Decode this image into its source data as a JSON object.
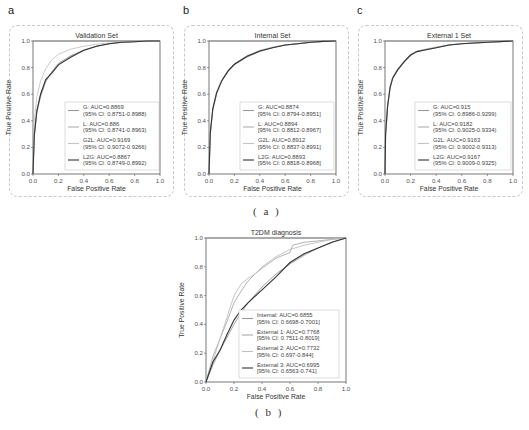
{
  "figure": {
    "caption_a": "( a )",
    "caption_b": "( b )",
    "panel_letters": [
      "a",
      "b",
      "c"
    ]
  },
  "chart_data": [
    {
      "type": "line",
      "panel": "a",
      "title": "Validation Set",
      "xlabel": "False Positive Rate",
      "ylabel": "True Positive Rate",
      "xlim": [
        0,
        1
      ],
      "ylim": [
        0,
        1
      ],
      "xticks": [
        "0.0",
        "0.2",
        "0.4",
        "0.6",
        "0.8",
        "1.0"
      ],
      "yticks": [
        "0.0",
        "0.2",
        "0.4",
        "0.6",
        "0.8",
        "1.0"
      ],
      "legend_position": "lower right",
      "series": [
        {
          "name": "G",
          "label": "G: AUC=0.8869",
          "ci": "(95% CI: 0.8751-0.8988)",
          "auc": 0.8869,
          "color": "#9a9a9a",
          "x": [
            0,
            0.01,
            0.03,
            0.06,
            0.1,
            0.15,
            0.2,
            0.3,
            0.4,
            0.5,
            0.6,
            0.7,
            0.8,
            0.9,
            1.0
          ],
          "y": [
            0,
            0.3,
            0.48,
            0.6,
            0.7,
            0.77,
            0.83,
            0.89,
            0.93,
            0.96,
            0.98,
            0.99,
            0.995,
            1.0,
            1.0
          ]
        },
        {
          "name": "L",
          "label": "L: AUC=0.886",
          "ci": "(95% CI: 0.8741-0.8963)",
          "auc": 0.886,
          "color": "#b0b0b0",
          "x": [
            0,
            0.01,
            0.03,
            0.06,
            0.1,
            0.15,
            0.2,
            0.3,
            0.4,
            0.5,
            0.6,
            0.7,
            0.8,
            0.9,
            1.0
          ],
          "y": [
            0,
            0.28,
            0.46,
            0.58,
            0.69,
            0.77,
            0.83,
            0.89,
            0.93,
            0.96,
            0.98,
            0.99,
            0.995,
            1.0,
            1.0
          ]
        },
        {
          "name": "G2L",
          "label": "G2L: AUC=0.9169",
          "ci": "(95% CI: 0.9072-0.9266)",
          "auc": 0.9169,
          "color": "#c4c4c4",
          "x": [
            0,
            0.01,
            0.03,
            0.06,
            0.1,
            0.15,
            0.2,
            0.3,
            0.4,
            0.5,
            0.6,
            0.7,
            0.8,
            0.9,
            1.0
          ],
          "y": [
            0,
            0.4,
            0.58,
            0.7,
            0.79,
            0.86,
            0.9,
            0.94,
            0.96,
            0.975,
            0.985,
            0.99,
            0.995,
            1.0,
            1.0
          ]
        },
        {
          "name": "L2G",
          "label": "L2G: AUC=0.8867",
          "ci": "(95% CI: 0.8749-0.8992)",
          "auc": 0.8867,
          "color": "#333333",
          "x": [
            0,
            0.01,
            0.03,
            0.06,
            0.1,
            0.15,
            0.2,
            0.3,
            0.4,
            0.5,
            0.6,
            0.7,
            0.8,
            0.9,
            1.0
          ],
          "y": [
            0,
            0.29,
            0.47,
            0.6,
            0.71,
            0.76,
            0.82,
            0.88,
            0.93,
            0.96,
            0.98,
            0.99,
            0.995,
            1.0,
            1.0
          ]
        }
      ]
    },
    {
      "type": "line",
      "panel": "b",
      "title": "Internal Set",
      "xlabel": "False Positive Rate",
      "ylabel": "True Positive Rate",
      "xlim": [
        0,
        1
      ],
      "ylim": [
        0,
        1
      ],
      "xticks": [
        "0.0",
        "0.2",
        "0.4",
        "0.6",
        "0.8",
        "1.0"
      ],
      "yticks": [
        "0.0",
        "0.2",
        "0.4",
        "0.6",
        "0.8",
        "1.0"
      ],
      "legend_position": "lower right",
      "series": [
        {
          "name": "G",
          "label": "G: AUC=0.8874",
          "ci": "[95% CI: 0.8794-0.8951]",
          "auc": 0.8874,
          "color": "#9a9a9a",
          "x": [
            0,
            0.01,
            0.03,
            0.06,
            0.1,
            0.15,
            0.2,
            0.3,
            0.4,
            0.5,
            0.6,
            0.7,
            0.8,
            0.9,
            1.0
          ],
          "y": [
            0,
            0.3,
            0.48,
            0.6,
            0.7,
            0.77,
            0.82,
            0.88,
            0.92,
            0.95,
            0.97,
            0.98,
            0.99,
            0.997,
            1.0
          ]
        },
        {
          "name": "L",
          "label": "L: AUC=0.8894",
          "ci": "[95% CI: 0.8812-0.8967]",
          "auc": 0.8894,
          "color": "#b0b0b0",
          "x": [
            0,
            0.01,
            0.03,
            0.06,
            0.1,
            0.15,
            0.2,
            0.3,
            0.4,
            0.5,
            0.6,
            0.7,
            0.8,
            0.9,
            1.0
          ],
          "y": [
            0,
            0.31,
            0.49,
            0.61,
            0.7,
            0.775,
            0.825,
            0.885,
            0.925,
            0.95,
            0.97,
            0.98,
            0.99,
            0.997,
            1.0
          ]
        },
        {
          "name": "G2L",
          "label": "G2L: AUC=0.8912",
          "ci": "[95% CI: 0.8837-0.8991]",
          "auc": 0.8912,
          "color": "#c4c4c4",
          "x": [
            0,
            0.01,
            0.03,
            0.06,
            0.1,
            0.15,
            0.2,
            0.3,
            0.4,
            0.5,
            0.6,
            0.7,
            0.8,
            0.9,
            1.0
          ],
          "y": [
            0,
            0.32,
            0.5,
            0.62,
            0.71,
            0.78,
            0.83,
            0.89,
            0.93,
            0.955,
            0.97,
            0.98,
            0.99,
            0.997,
            1.0
          ]
        },
        {
          "name": "L2G",
          "label": "L2G: AUC=0.8893",
          "ci": "[95% CI: 0.8818-0.8968]",
          "auc": 0.8893,
          "color": "#333333",
          "x": [
            0,
            0.01,
            0.03,
            0.06,
            0.1,
            0.15,
            0.2,
            0.3,
            0.4,
            0.5,
            0.6,
            0.7,
            0.8,
            0.9,
            1.0
          ],
          "y": [
            0,
            0.31,
            0.49,
            0.61,
            0.7,
            0.775,
            0.825,
            0.885,
            0.925,
            0.95,
            0.97,
            0.98,
            0.99,
            0.997,
            1.0
          ]
        }
      ]
    },
    {
      "type": "line",
      "panel": "c",
      "title": "External 1 Set",
      "xlabel": "False Positive Rate",
      "ylabel": "True Positive Rate",
      "xlim": [
        0,
        1
      ],
      "ylim": [
        0,
        1
      ],
      "xticks": [
        "0.0",
        "0.2",
        "0.4",
        "0.6",
        "0.8",
        "1.0"
      ],
      "yticks": [
        "0.0",
        "0.2",
        "0.4",
        "0.6",
        "0.8",
        "1.0"
      ],
      "legend_position": "lower right",
      "series": [
        {
          "name": "G",
          "label": "G: AUC=0.915",
          "ci": "(95% CI: 0.8986-0.9299)",
          "auc": 0.915,
          "color": "#9a9a9a",
          "x": [
            0,
            0.005,
            0.02,
            0.04,
            0.06,
            0.1,
            0.15,
            0.2,
            0.25,
            0.3,
            0.4,
            0.5,
            0.6,
            0.8,
            1.0
          ],
          "y": [
            0,
            0.3,
            0.5,
            0.65,
            0.72,
            0.78,
            0.84,
            0.89,
            0.92,
            0.93,
            0.95,
            0.97,
            0.98,
            0.99,
            1.0
          ]
        },
        {
          "name": "L",
          "label": "L: AUC=0.9182",
          "ci": "(95% CI: 0.9025-0.9334)",
          "auc": 0.9182,
          "color": "#b0b0b0",
          "x": [
            0,
            0.005,
            0.02,
            0.04,
            0.06,
            0.1,
            0.15,
            0.2,
            0.25,
            0.3,
            0.4,
            0.5,
            0.6,
            0.8,
            1.0
          ],
          "y": [
            0,
            0.31,
            0.52,
            0.66,
            0.73,
            0.79,
            0.85,
            0.9,
            0.925,
            0.935,
            0.955,
            0.97,
            0.98,
            0.99,
            1.0
          ]
        },
        {
          "name": "G2L",
          "label": "G2L: AUC=0.9163",
          "ci": "(95% CI: 0.9002-0.9313)",
          "auc": 0.9163,
          "color": "#c4c4c4",
          "x": [
            0,
            0.005,
            0.02,
            0.04,
            0.06,
            0.1,
            0.15,
            0.2,
            0.25,
            0.3,
            0.4,
            0.5,
            0.6,
            0.8,
            1.0
          ],
          "y": [
            0,
            0.3,
            0.51,
            0.65,
            0.72,
            0.785,
            0.845,
            0.895,
            0.92,
            0.93,
            0.95,
            0.97,
            0.98,
            0.99,
            1.0
          ]
        },
        {
          "name": "L2G",
          "label": "L2G: AUC=0.9167",
          "ci": "(95% CI: 0.9009-0.9325)",
          "auc": 0.9167,
          "color": "#333333",
          "x": [
            0,
            0.005,
            0.02,
            0.04,
            0.06,
            0.1,
            0.15,
            0.2,
            0.25,
            0.3,
            0.4,
            0.5,
            0.6,
            0.8,
            1.0
          ],
          "y": [
            0,
            0.3,
            0.51,
            0.65,
            0.72,
            0.785,
            0.845,
            0.895,
            0.92,
            0.93,
            0.95,
            0.97,
            0.98,
            0.99,
            1.0
          ]
        }
      ]
    },
    {
      "type": "line",
      "panel": "b-bottom",
      "title": "T2DM diagnosis",
      "xlabel": "False Positive Rate",
      "ylabel": "True Positive Rate",
      "xlim": [
        0,
        1
      ],
      "ylim": [
        0,
        1
      ],
      "xticks": [
        "0.0",
        "0.2",
        "0.4",
        "0.6",
        "0.8",
        "1.0"
      ],
      "yticks": [
        "0.0",
        "0.2",
        "0.4",
        "0.6",
        "0.8",
        "1.0"
      ],
      "legend_position": "lower right",
      "series": [
        {
          "name": "Internal",
          "label": "Internal: AUC=0.6855",
          "ci": "[95% CI: 0.6698-0.7001]",
          "auc": 0.6855,
          "color": "#9a9a9a",
          "x": [
            0,
            0.05,
            0.1,
            0.15,
            0.2,
            0.25,
            0.3,
            0.4,
            0.5,
            0.6,
            0.7,
            0.8,
            0.9,
            1.0
          ],
          "y": [
            0,
            0.12,
            0.22,
            0.31,
            0.4,
            0.48,
            0.55,
            0.66,
            0.75,
            0.82,
            0.88,
            0.93,
            0.97,
            1.0
          ]
        },
        {
          "name": "External 1",
          "label": "External 1: AUC=0.7768",
          "ci": "[95% CI: 0.7511-0.8019]",
          "auc": 0.7768,
          "color": "#aaaaaa",
          "x": [
            0,
            0.05,
            0.1,
            0.15,
            0.2,
            0.25,
            0.3,
            0.35,
            0.4,
            0.5,
            0.6,
            0.62,
            0.7,
            0.8,
            0.9,
            1.0
          ],
          "y": [
            0,
            0.18,
            0.3,
            0.42,
            0.55,
            0.63,
            0.7,
            0.75,
            0.79,
            0.86,
            0.9,
            0.95,
            0.97,
            0.98,
            0.99,
            1.0
          ]
        },
        {
          "name": "External 2",
          "label": "External 2: AUC=0.7732",
          "ci": "[95% CI: 0.697-0.844]",
          "auc": 0.7732,
          "color": "#c0c0c0",
          "x": [
            0,
            0.05,
            0.1,
            0.15,
            0.2,
            0.25,
            0.3,
            0.35,
            0.4,
            0.5,
            0.6,
            0.7,
            0.8,
            0.9,
            1.0
          ],
          "y": [
            0,
            0.15,
            0.3,
            0.45,
            0.6,
            0.68,
            0.72,
            0.75,
            0.8,
            0.87,
            0.92,
            0.95,
            0.97,
            0.99,
            1.0
          ]
        },
        {
          "name": "External 3",
          "label": "External 3: AUC=0.6995",
          "ci": "[95% CI: 0.6563-0.741]",
          "auc": 0.6995,
          "color": "#333333",
          "x": [
            0,
            0.05,
            0.1,
            0.15,
            0.2,
            0.25,
            0.3,
            0.4,
            0.5,
            0.6,
            0.7,
            0.8,
            0.9,
            1.0
          ],
          "y": [
            0,
            0.14,
            0.22,
            0.33,
            0.43,
            0.5,
            0.55,
            0.64,
            0.73,
            0.83,
            0.89,
            0.93,
            0.97,
            1.0
          ]
        }
      ]
    }
  ]
}
